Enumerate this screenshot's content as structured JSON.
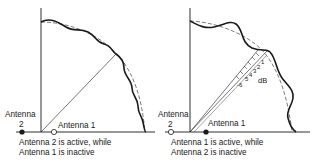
{
  "figure": {
    "left_panel": {
      "antenna_left_label_line1": "Antenna",
      "antenna_left_label_line2": "2",
      "antenna_right_label": "Antenna 1",
      "active_antenna": "Antenna 2",
      "inactive_antenna": "Antenna 1",
      "caption_line1": "Antenna 2 is active, while",
      "caption_line2": "Antenna 1 is inactive"
    },
    "right_panel": {
      "antenna_left_label_line1": "Antenna",
      "antenna_left_label_line2": "2",
      "antenna_right_label": "Antenna 1",
      "active_antenna": "Antenna 1",
      "inactive_antenna": "Antenna 2",
      "caption_line1": "Antenna 1 is active, while",
      "caption_line2": "Antenna 2 is inactive",
      "db_scale": {
        "ticks": [
          "-6",
          "5",
          "4",
          "3",
          "2",
          "1"
        ],
        "unit": "dB"
      }
    },
    "legend": {
      "solid_curve": "measured radiation pattern",
      "dashed_curve": "ideal radiation pattern"
    },
    "colors": {
      "ink": "#1a1a1a",
      "background": "#ffffff"
    }
  }
}
